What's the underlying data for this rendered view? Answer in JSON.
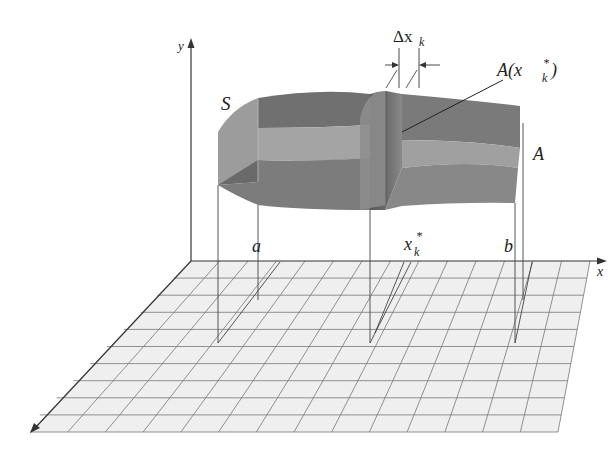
{
  "figure": {
    "labels": {
      "solid": "S",
      "cross_section_area": "A",
      "slab_width_delta": "Δx",
      "slab_width_sub": "k",
      "area_at_sample_A": "A(x",
      "area_at_sample_sub": "k",
      "area_at_sample_sup": "*",
      "area_at_sample_close": ")",
      "lower_limit": "a",
      "sample_point": "x",
      "sample_point_sub": "k",
      "sample_point_sup": "*",
      "upper_limit": "b",
      "x_axis": "x",
      "y_axis": "y"
    },
    "colors": {
      "surface_dark": "#6e6e6e",
      "surface_mid": "#8c8c8c",
      "surface_light": "#a6a6a6",
      "end_face": "#9a9a9a",
      "slab": "#7a7a7a",
      "grid_fill": "#efefef",
      "grid_lines": "#777777",
      "axis": "#333333"
    },
    "grid": {
      "rows": 10,
      "columns": 14
    }
  }
}
